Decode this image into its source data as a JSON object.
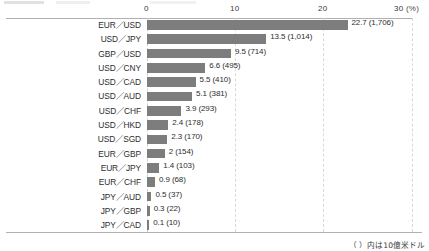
{
  "chart_data": {
    "type": "bar",
    "orientation": "horizontal",
    "title": "",
    "xlabel": "(%)",
    "ylabel": "",
    "xlim": [
      0,
      30
    ],
    "xticks": [
      "0",
      "10",
      "20",
      "30"
    ],
    "xtick_values": [
      0,
      10,
      20,
      30
    ],
    "unit_suffix": "(%)",
    "grid": true,
    "legend": null,
    "bar_color": "#7d7d7d",
    "categories": [
      "EUR／USD",
      "USD／JPY",
      "GBP／USD",
      "USD／CNY",
      "USD／CAD",
      "USD／AUD",
      "USD／CHF",
      "USD／HKD",
      "USD／SGD",
      "EUR／GBP",
      "EUR／JPY",
      "EUR／CHF",
      "JPY／AUD",
      "JPY／GBP",
      "JPY／CAD"
    ],
    "values": [
      22.7,
      13.5,
      9.5,
      6.6,
      5.5,
      5.1,
      3.9,
      2.4,
      2.3,
      2,
      1.4,
      0.9,
      0.5,
      0.3,
      0.1
    ],
    "value_labels": [
      "22.7 (1,706)",
      "13.5 (1,014)",
      "9.5 (714)",
      "6.6 (495)",
      "5.5 (410)",
      "5.1 (381)",
      "3.9 (293)",
      "2.4 (178)",
      "2.3 (170)",
      "2 (154)",
      "1.4 (103)",
      "0.9 (68)",
      "0.5 (37)",
      "0.3 (22)",
      "0.1 (10)"
    ],
    "amounts_billion_usd": [
      1706,
      1014,
      714,
      495,
      410,
      381,
      293,
      178,
      170,
      154,
      103,
      68,
      37,
      22,
      10
    ],
    "annotations": [
      "（ ）内は10億米ドル"
    ]
  },
  "footnote": "（ ）内は10億米ドル"
}
